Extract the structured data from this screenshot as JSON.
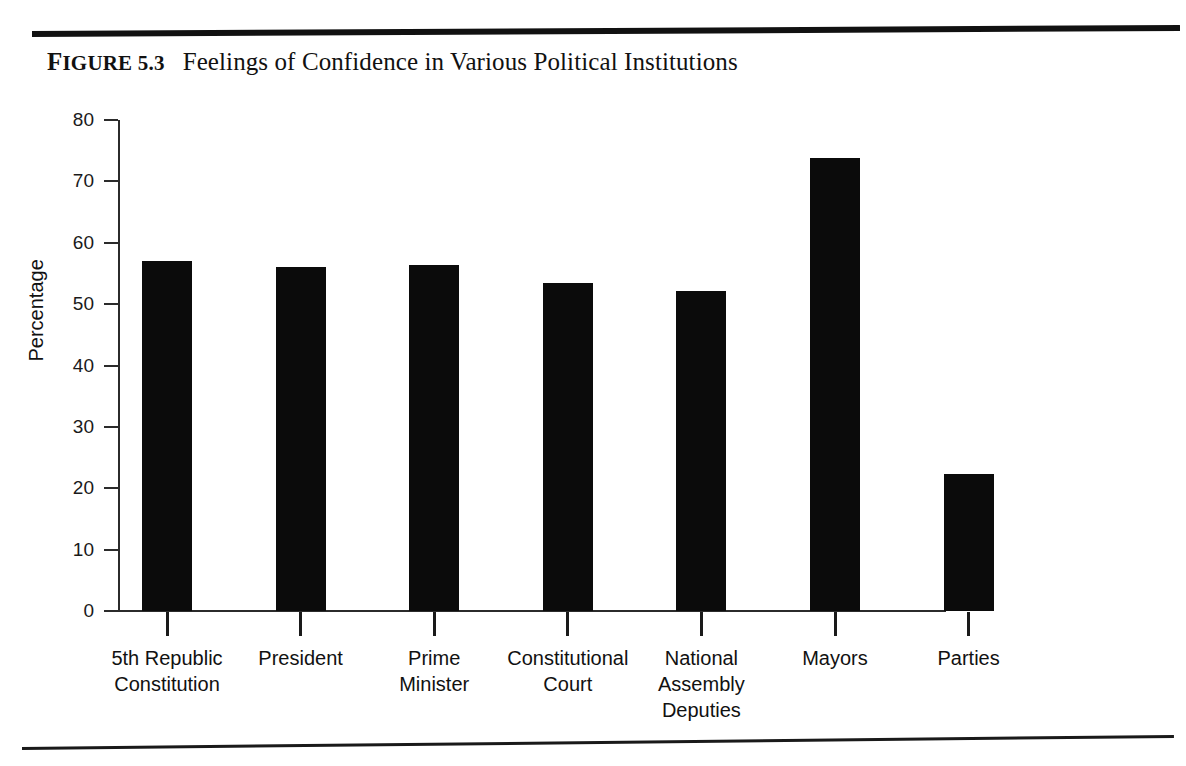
{
  "figure": {
    "label_prefix": "F",
    "label_rest": "IGURE",
    "number": "5.3",
    "title": "Feelings of Confidence in Various Political Institutions"
  },
  "chart_data": {
    "type": "bar",
    "title": "Feelings of Confidence in Various Political Institutions",
    "xlabel": "",
    "ylabel": "Percentage",
    "ylim": [
      0,
      80
    ],
    "ytick_labels": [
      "80",
      "70",
      "60",
      "50",
      "40",
      "30",
      "20",
      "10",
      "0"
    ],
    "yticks": [
      80,
      70,
      60,
      50,
      40,
      30,
      20,
      10,
      0
    ],
    "grid": false,
    "legend": null,
    "bar_color": "#0b0b0b",
    "categories": [
      "5th Republic\nConstitution",
      "President",
      "Prime\nMinister",
      "Constitutional\nCourt",
      "National\nAssembly\nDeputies",
      "Mayors",
      "Parties"
    ],
    "category_lines": [
      [
        "5th Republic",
        "Constitution"
      ],
      [
        "President"
      ],
      [
        "Prime",
        "Minister"
      ],
      [
        "Constitutional",
        "Court"
      ],
      [
        "National",
        "Assembly",
        "Deputies"
      ],
      [
        "Mayors"
      ],
      [
        "Parties"
      ]
    ],
    "values": [
      57.0,
      56.1,
      56.3,
      53.4,
      52.2,
      73.8,
      22.3
    ]
  }
}
